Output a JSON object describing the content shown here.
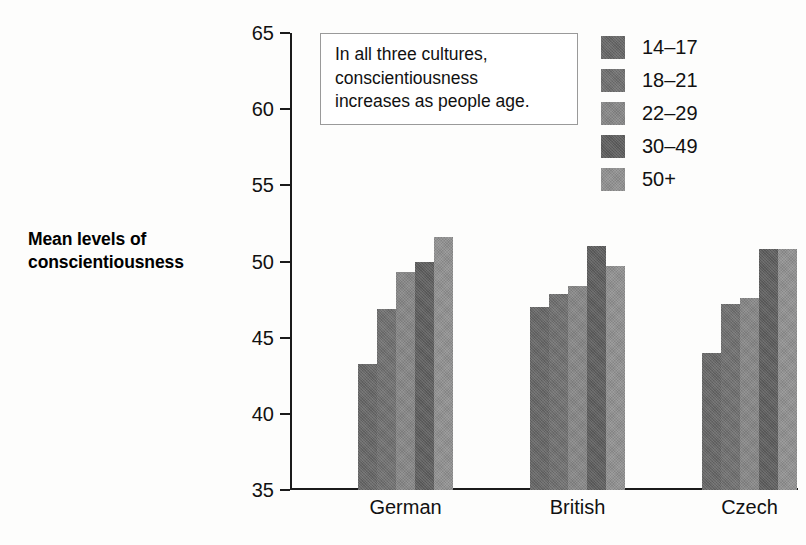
{
  "chart_data": {
    "type": "bar",
    "title": "",
    "xlabel": "",
    "ylabel": "Mean levels of conscientiousness",
    "ylim": [
      35,
      65
    ],
    "yticks": [
      35,
      40,
      45,
      50,
      55,
      60,
      65
    ],
    "grid": false,
    "legend_position": "top-right",
    "categories": [
      "German",
      "British",
      "Czech"
    ],
    "series": [
      {
        "name": "14–17",
        "color": "#676767",
        "values": [
          43.3,
          47.0,
          44.0
        ]
      },
      {
        "name": "18–21",
        "color": "#707070",
        "values": [
          46.9,
          47.9,
          47.2
        ]
      },
      {
        "name": "22–29",
        "color": "#878787",
        "values": [
          49.3,
          48.4,
          47.6
        ]
      },
      {
        "name": "30–49",
        "color": "#5e5e5e",
        "values": [
          50.0,
          51.0,
          50.8
        ]
      },
      {
        "name": "50+",
        "color": "#919191",
        "values": [
          51.6,
          49.7,
          50.8
        ]
      }
    ],
    "annotations": [
      {
        "text": "In all three cultures, conscientiousness increases as people age."
      }
    ]
  },
  "axis": {
    "title_line1": "Mean levels of",
    "title_line2": "conscientiousness"
  },
  "callout": {
    "line1": "In all three cultures,",
    "line2": "conscientiousness",
    "line3": "increases as people age."
  }
}
